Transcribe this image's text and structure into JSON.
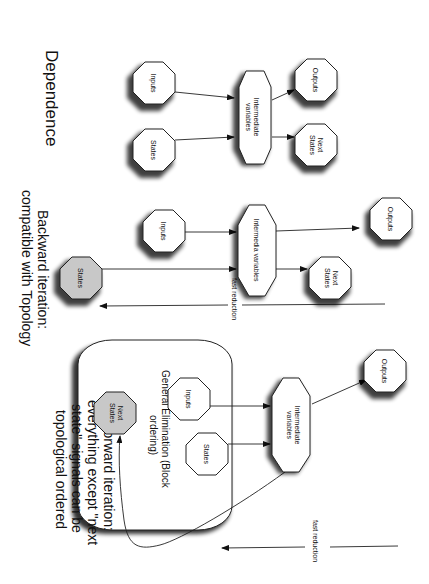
{
  "orientation": "rotated-90-clockwise",
  "sections": [
    {
      "title": "Dependence",
      "nodes": {
        "inputs": "Inputs",
        "states": "States",
        "intermediate_line1": "Intermediate",
        "intermediate_line2": "variables",
        "outputs": "Outputs",
        "next_states_line1": "Next",
        "next_states_line2": "States"
      }
    },
    {
      "title_line1": "Backward iteration:",
      "title_line2": "compatible with Topology",
      "nodes": {
        "inputs": "Inputs",
        "states": "States",
        "intermediate": "Intermedia variables",
        "outputs": "Outputs",
        "next_states_line1": "Next",
        "next_states_line2": "States"
      },
      "arrow_label": "fast reduction"
    },
    {
      "title_line1": "Forward iteration:",
      "title_line2": "everything except \"next",
      "title_line3": "state\" signals can be",
      "title_line4": "topological ordered",
      "box_label_line1": "General Elimination (Block",
      "box_label_line2": "ordering)",
      "nodes": {
        "inputs": "Inputs",
        "states": "States",
        "next_states_line1": "Next",
        "next_states_line2": "States",
        "intermediate_line1": "Intermediate",
        "intermediate_line2": "variables",
        "outputs": "Outputs"
      },
      "arrow_label": "fast reduction"
    }
  ],
  "colors": {
    "highlight_node": "#c8c8c8",
    "line": "#222222",
    "background": "#ffffff"
  }
}
